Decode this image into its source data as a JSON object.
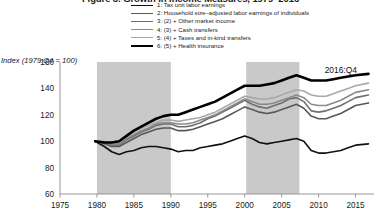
{
  "title": "Figure 3. Growth in Income Measures, 1979–2016",
  "legend": {
    "position": "top-center",
    "items": [
      {
        "label": "1: Tax unit labor earnings",
        "color": "#111111",
        "width": 1.6
      },
      {
        "label": "2: Household size–adjusted labor earnings of individuals",
        "color": "#585858",
        "width": 1.6
      },
      {
        "label": "3: (2) + Other market income",
        "color": "#6f6f6f",
        "width": 1.6
      },
      {
        "label": "4: (3) + Cash transfers",
        "color": "#8a8a8a",
        "width": 1.6
      },
      {
        "label": "5: (4) + Taxes and in-kind transfers",
        "color": "#a8a8a8",
        "width": 1.6
      },
      {
        "label": "6: (5) + Health insurance",
        "color": "#000000",
        "width": 2.6
      }
    ]
  },
  "axes": {
    "ylabel": "Index (1979:Q4 = 100)",
    "yticks": [
      60,
      80,
      100,
      120,
      140,
      160
    ],
    "ylim": [
      60,
      160
    ],
    "xticks": [
      1975,
      1980,
      1985,
      1990,
      1995,
      2000,
      2005,
      2010,
      2015
    ],
    "xlim": [
      1975,
      2017.5
    ],
    "grid": false
  },
  "annotations": [
    {
      "text": "2016:Q4",
      "x": 2013.0,
      "y": 152.0
    }
  ],
  "shaded_bands": [
    {
      "x0": 1980.0,
      "x1": 1990.0,
      "color": "#c9c9c9"
    },
    {
      "x0": 2000.2,
      "x1": 2007.4,
      "color": "#c9c9c9"
    }
  ],
  "chart_data": {
    "type": "line",
    "title": "Figure 3. Growth in Income Measures, 1979–2016",
    "xlabel": "",
    "ylabel": "Index (1979:Q4 = 100)",
    "xlim": [
      1975,
      2017.5
    ],
    "ylim": [
      60,
      160
    ],
    "grid": false,
    "legend_position": "top-center",
    "x": [
      1979.75,
      1981,
      1982,
      1983,
      1984,
      1985,
      1986,
      1987,
      1988,
      1989,
      1990,
      1991,
      1992,
      1993,
      1994,
      1995,
      1996,
      1997,
      1998,
      1999,
      2000,
      2001,
      2002,
      2003,
      2004,
      2005,
      2006,
      2007,
      2008,
      2009,
      2010,
      2011,
      2012,
      2013,
      2014,
      2015,
      2016.75
    ],
    "series": [
      {
        "name": "1: Tax unit labor earnings",
        "color": "#111111",
        "width": 1.6,
        "values": [
          100,
          96,
          92,
          90,
          92,
          93,
          95,
          96,
          96,
          95,
          94,
          92,
          93,
          93,
          95,
          96,
          97,
          98,
          100,
          102,
          104,
          102,
          99,
          98,
          99,
          100,
          101,
          102,
          100,
          93,
          91,
          91,
          92,
          93,
          95,
          97,
          98
        ]
      },
      {
        "name": "2: Household size–adjusted labor earnings of individuals",
        "color": "#585858",
        "width": 1.6,
        "values": [
          100,
          98,
          96,
          96,
          99,
          102,
          105,
          107,
          109,
          110,
          110,
          108,
          108,
          109,
          111,
          113,
          115,
          117,
          120,
          123,
          126,
          124,
          122,
          121,
          122,
          124,
          126,
          128,
          125,
          119,
          117,
          117,
          119,
          121,
          124,
          127,
          129
        ]
      },
      {
        "name": "3: (2) + Other market income",
        "color": "#6f6f6f",
        "width": 1.6,
        "values": [
          100,
          98,
          97,
          97,
          101,
          104,
          107,
          109,
          112,
          113,
          113,
          111,
          111,
          112,
          114,
          117,
          119,
          122,
          125,
          128,
          131,
          128,
          126,
          125,
          127,
          129,
          132,
          133,
          130,
          123,
          122,
          123,
          125,
          127,
          130,
          133,
          135
        ]
      },
      {
        "name": "4: (3) + Cash transfers",
        "color": "#8a8a8a",
        "width": 1.6,
        "values": [
          100,
          99,
          98,
          98,
          102,
          105,
          108,
          110,
          113,
          114,
          114,
          113,
          113,
          114,
          116,
          118,
          120,
          123,
          126,
          129,
          132,
          130,
          128,
          128,
          129,
          131,
          133,
          135,
          133,
          128,
          127,
          127,
          129,
          131,
          134,
          137,
          139
        ]
      },
      {
        "name": "5: (4) + Taxes and in-kind transfers",
        "color": "#a8a8a8",
        "width": 1.6,
        "values": [
          100,
          100,
          99,
          100,
          104,
          107,
          110,
          112,
          114,
          116,
          116,
          115,
          116,
          117,
          118,
          120,
          122,
          125,
          128,
          131,
          134,
          133,
          132,
          132,
          133,
          135,
          137,
          139,
          138,
          135,
          134,
          134,
          136,
          138,
          140,
          142,
          144
        ]
      },
      {
        "name": "6: (5) + Health insurance",
        "color": "#000000",
        "width": 2.6,
        "values": [
          100,
          99,
          99,
          100,
          104,
          108,
          111,
          114,
          117,
          119,
          120,
          120,
          122,
          124,
          126,
          128,
          130,
          133,
          136,
          139,
          142,
          142,
          142,
          143,
          144,
          146,
          148,
          150,
          148,
          146,
          146,
          146,
          147,
          148,
          149,
          150,
          151
        ]
      }
    ]
  }
}
